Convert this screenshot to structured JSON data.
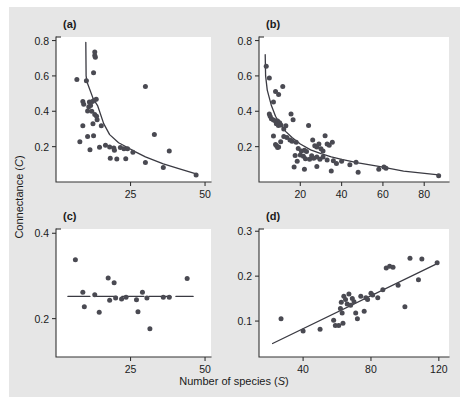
{
  "figure": {
    "background_color": "#e6e6e6",
    "plot_background_color": "#ffffff",
    "marker_color": "#4a4a52",
    "axis_color": "#333333",
    "shared_xlabel": "Number of species (",
    "shared_xlabel_symbol": "S",
    "shared_xlabel_close": ")",
    "shared_ylabel": "Connectance (",
    "shared_ylabel_symbol": "C",
    "shared_ylabel_close": ")"
  },
  "chart_data": [
    {
      "type": "scatter",
      "panel": "(a)",
      "title": "",
      "xlabel": "Number of species (S)",
      "ylabel": "Connectance (C)",
      "xlim": [
        0,
        52
      ],
      "ylim": [
        0,
        0.82
      ],
      "xticks": [
        25,
        50
      ],
      "xticklabels": [
        "25",
        "50"
      ],
      "yticks": [
        0.2,
        0.4,
        0.6,
        0.8
      ],
      "yticklabels": [
        "0.2",
        "0.4",
        "0.6",
        "0.8"
      ],
      "grid": false,
      "legend": "none",
      "points": [
        [
          13.0,
          0.735
        ],
        [
          13.0,
          0.715
        ],
        [
          13.2,
          0.705
        ],
        [
          7.0,
          0.58
        ],
        [
          10.2,
          0.572
        ],
        [
          12.6,
          0.618
        ],
        [
          30.0,
          0.54
        ],
        [
          9.0,
          0.455
        ],
        [
          9.3,
          0.44
        ],
        [
          11.2,
          0.452
        ],
        [
          12.2,
          0.455
        ],
        [
          12.8,
          0.462
        ],
        [
          13.5,
          0.468
        ],
        [
          11.0,
          0.425
        ],
        [
          11.6,
          0.432
        ],
        [
          10.6,
          0.402
        ],
        [
          12.0,
          0.4
        ],
        [
          13.0,
          0.382
        ],
        [
          13.6,
          0.372
        ],
        [
          13.8,
          0.352
        ],
        [
          9.0,
          0.318
        ],
        [
          12.4,
          0.33
        ],
        [
          15.2,
          0.318
        ],
        [
          10.6,
          0.258
        ],
        [
          12.6,
          0.262
        ],
        [
          8.0,
          0.228
        ],
        [
          11.4,
          0.182
        ],
        [
          14.6,
          0.196
        ],
        [
          16.6,
          0.208
        ],
        [
          18.0,
          0.198
        ],
        [
          19.4,
          0.192
        ],
        [
          19.6,
          0.18
        ],
        [
          21.6,
          0.195
        ],
        [
          22.8,
          0.188
        ],
        [
          24.0,
          0.188
        ],
        [
          25.8,
          0.168
        ],
        [
          33.0,
          0.268
        ],
        [
          38.0,
          0.175
        ],
        [
          18.2,
          0.135
        ],
        [
          20.4,
          0.13
        ],
        [
          23.4,
          0.132
        ],
        [
          30.0,
          0.11
        ],
        [
          36.0,
          0.082
        ],
        [
          47.0,
          0.04
        ]
      ],
      "fit_line": [
        [
          10.0,
          0.79
        ],
        [
          10.1,
          0.6
        ],
        [
          10.4,
          0.565
        ],
        [
          12.5,
          0.47
        ],
        [
          14.0,
          0.43
        ],
        [
          16.0,
          0.33
        ],
        [
          18.0,
          0.268
        ],
        [
          21.0,
          0.222
        ],
        [
          24.0,
          0.195
        ],
        [
          26.5,
          0.172
        ],
        [
          30.0,
          0.142
        ],
        [
          36.0,
          0.102
        ],
        [
          42.0,
          0.072
        ],
        [
          47.0,
          0.046
        ]
      ]
    },
    {
      "type": "scatter",
      "panel": "(b)",
      "title": "",
      "xlabel": "Number of species (S)",
      "ylabel": "Connectance (C)",
      "xlim": [
        0,
        92
      ],
      "ylim": [
        0,
        0.82
      ],
      "xticks": [
        20,
        40,
        60,
        80
      ],
      "xticklabels": [
        "20",
        "40",
        "60",
        "80"
      ],
      "yticks": [
        0.2,
        0.4,
        0.6,
        0.8
      ],
      "yticklabels": [
        "0.2",
        "0.4",
        "0.6",
        "0.8"
      ],
      "grid": false,
      "legend": "none",
      "points": [
        [
          3.5,
          0.655
        ],
        [
          5.0,
          0.588
        ],
        [
          8.0,
          0.512
        ],
        [
          9.5,
          0.495
        ],
        [
          11.5,
          0.54
        ],
        [
          7.0,
          0.452
        ],
        [
          5.0,
          0.385
        ],
        [
          5.4,
          0.372
        ],
        [
          6.0,
          0.358
        ],
        [
          7.0,
          0.35
        ],
        [
          8.0,
          0.345
        ],
        [
          8.4,
          0.33
        ],
        [
          9.0,
          0.345
        ],
        [
          9.4,
          0.32
        ],
        [
          10.0,
          0.335
        ],
        [
          10.6,
          0.322
        ],
        [
          12.0,
          0.3
        ],
        [
          13.0,
          0.318
        ],
        [
          15.5,
          0.385
        ],
        [
          16.5,
          0.352
        ],
        [
          7.0,
          0.26
        ],
        [
          8.0,
          0.212
        ],
        [
          8.5,
          0.205
        ],
        [
          9.0,
          0.195
        ],
        [
          9.5,
          0.198
        ],
        [
          10.5,
          0.228
        ],
        [
          12.0,
          0.258
        ],
        [
          13.5,
          0.252
        ],
        [
          15.0,
          0.238
        ],
        [
          16.0,
          0.23
        ],
        [
          18.0,
          0.225
        ],
        [
          19.0,
          0.19
        ],
        [
          20.5,
          0.175
        ],
        [
          22.0,
          0.18
        ],
        [
          23.0,
          0.172
        ],
        [
          24.0,
          0.32
        ],
        [
          26.0,
          0.238
        ],
        [
          27.0,
          0.205
        ],
        [
          28.0,
          0.198
        ],
        [
          29.0,
          0.215
        ],
        [
          30.0,
          0.188
        ],
        [
          32.0,
          0.262
        ],
        [
          33.0,
          0.215
        ],
        [
          34.0,
          0.208
        ],
        [
          35.5,
          0.225
        ],
        [
          31.0,
          0.175
        ],
        [
          17.5,
          0.15
        ],
        [
          18.5,
          0.118
        ],
        [
          20.0,
          0.152
        ],
        [
          21.5,
          0.145
        ],
        [
          22.5,
          0.132
        ],
        [
          24.5,
          0.128
        ],
        [
          25.5,
          0.148
        ],
        [
          26.5,
          0.135
        ],
        [
          28.0,
          0.142
        ],
        [
          29.5,
          0.128
        ],
        [
          31.0,
          0.142
        ],
        [
          33.0,
          0.125
        ],
        [
          36.0,
          0.12
        ],
        [
          37.5,
          0.105
        ],
        [
          40.0,
          0.118
        ],
        [
          17.0,
          0.085
        ],
        [
          22.0,
          0.072
        ],
        [
          28.0,
          0.088
        ],
        [
          35.0,
          0.062
        ],
        [
          44.0,
          0.098
        ],
        [
          47.0,
          0.112
        ],
        [
          48.0,
          0.055
        ],
        [
          58.0,
          0.072
        ],
        [
          60.5,
          0.085
        ],
        [
          61.5,
          0.078
        ],
        [
          87.0,
          0.035
        ]
      ],
      "fit_line": [
        [
          3.0,
          0.72
        ],
        [
          3.2,
          0.6
        ],
        [
          4.0,
          0.52
        ],
        [
          6.0,
          0.432
        ],
        [
          8.0,
          0.372
        ],
        [
          10.0,
          0.33
        ],
        [
          13.0,
          0.285
        ],
        [
          16.0,
          0.252
        ],
        [
          20.0,
          0.215
        ],
        [
          25.0,
          0.182
        ],
        [
          30.0,
          0.16
        ],
        [
          35.0,
          0.142
        ],
        [
          40.0,
          0.128
        ],
        [
          48.0,
          0.108
        ],
        [
          58.0,
          0.088
        ],
        [
          70.0,
          0.062
        ],
        [
          87.0,
          0.04
        ]
      ]
    },
    {
      "type": "scatter",
      "panel": "(c)",
      "title": "",
      "xlabel": "Number of species (S)",
      "ylabel": "Connectance (C)",
      "xlim": [
        0,
        52
      ],
      "ylim": [
        0.11,
        0.41
      ],
      "xticks": [
        25,
        50
      ],
      "xticklabels": [
        "25",
        "50"
      ],
      "yticks": [
        0.2,
        0.4
      ],
      "yticklabels": [
        "0.2",
        "0.4"
      ],
      "grid": false,
      "legend": "none",
      "points": [
        [
          6.5,
          0.338
        ],
        [
          9.0,
          0.262
        ],
        [
          9.5,
          0.228
        ],
        [
          13.0,
          0.256
        ],
        [
          14.5,
          0.215
        ],
        [
          17.5,
          0.295
        ],
        [
          18.0,
          0.243
        ],
        [
          19.5,
          0.284
        ],
        [
          20.0,
          0.248
        ],
        [
          22.0,
          0.246
        ],
        [
          23.5,
          0.25
        ],
        [
          27.0,
          0.244
        ],
        [
          27.5,
          0.216
        ],
        [
          29.0,
          0.262
        ],
        [
          30.5,
          0.248
        ],
        [
          31.5,
          0.176
        ],
        [
          36.0,
          0.25
        ],
        [
          38.0,
          0.25
        ],
        [
          44.0,
          0.294
        ]
      ],
      "fit_line": [
        [
          4.0,
          0.252
        ],
        [
          46.0,
          0.252
        ]
      ],
      "fit_line_style": "dashed-segments"
    },
    {
      "type": "scatter",
      "panel": "(d)",
      "title": "",
      "xlabel": "Number of species (S)",
      "ylabel": "Connectance (C)",
      "xlim": [
        14,
        126
      ],
      "ylim": [
        0.02,
        0.305
      ],
      "xticks": [
        40,
        80,
        120
      ],
      "xticklabels": [
        "40",
        "80",
        "120"
      ],
      "yticks": [
        0.1,
        0.2,
        0.3
      ],
      "yticklabels": [
        "0.1",
        "0.2",
        "0.3"
      ],
      "grid": false,
      "legend": "none",
      "points": [
        [
          27.0,
          0.105
        ],
        [
          40.0,
          0.078
        ],
        [
          50.0,
          0.082
        ],
        [
          58.0,
          0.102
        ],
        [
          59.0,
          0.09
        ],
        [
          61.0,
          0.09
        ],
        [
          62.0,
          0.128
        ],
        [
          62.5,
          0.142
        ],
        [
          63.0,
          0.118
        ],
        [
          63.5,
          0.095
        ],
        [
          64.0,
          0.155
        ],
        [
          65.0,
          0.148
        ],
        [
          66.0,
          0.138
        ],
        [
          67.0,
          0.16
        ],
        [
          68.0,
          0.135
        ],
        [
          69.0,
          0.15
        ],
        [
          70.0,
          0.143
        ],
        [
          71.0,
          0.118
        ],
        [
          72.0,
          0.105
        ],
        [
          74.0,
          0.155
        ],
        [
          76.0,
          0.122
        ],
        [
          77.0,
          0.152
        ],
        [
          78.0,
          0.148
        ],
        [
          80.0,
          0.162
        ],
        [
          81.0,
          0.158
        ],
        [
          84.0,
          0.152
        ],
        [
          87.0,
          0.17
        ],
        [
          89.0,
          0.218
        ],
        [
          91.0,
          0.222
        ],
        [
          93.0,
          0.22
        ],
        [
          96.0,
          0.18
        ],
        [
          100.0,
          0.132
        ],
        [
          103.0,
          0.24
        ],
        [
          108.0,
          0.192
        ],
        [
          110.0,
          0.238
        ],
        [
          119.0,
          0.23
        ]
      ],
      "fit_line": [
        [
          22.0,
          0.05
        ],
        [
          119.0,
          0.228
        ]
      ],
      "fit_line_style": "solid"
    }
  ]
}
